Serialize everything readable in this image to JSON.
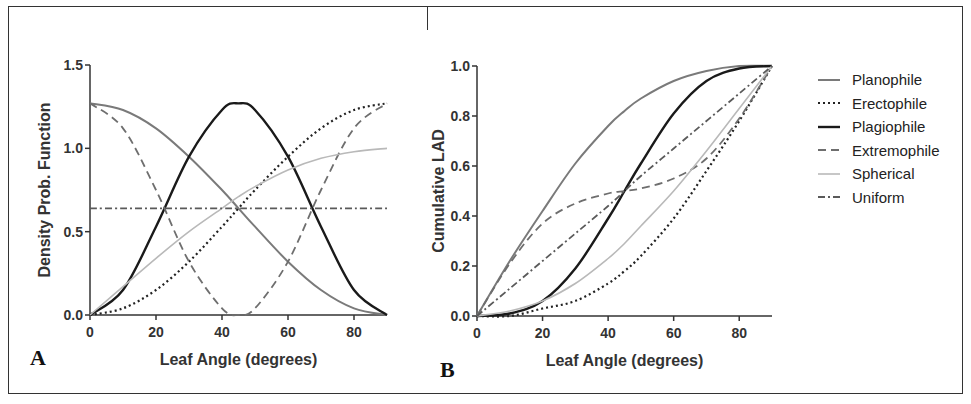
{
  "figure": {
    "panel_labels": [
      "A",
      "B"
    ]
  },
  "legend": {
    "items": [
      {
        "label": "Planophile",
        "color": "#7a7a7a",
        "dash": "",
        "width": 2
      },
      {
        "label": "Erectophile",
        "color": "#222222",
        "dash": "2,3",
        "width": 2.2
      },
      {
        "label": "Plagiophile",
        "color": "#1a1a1a",
        "dash": "",
        "width": 2.4
      },
      {
        "label": "Extremophile",
        "color": "#6e6e6e",
        "dash": "8,5",
        "width": 1.8
      },
      {
        "label": "Spherical",
        "color": "#b9b9b9",
        "dash": "",
        "width": 1.6
      },
      {
        "label": "Uniform",
        "color": "#5a5a5a",
        "dash": "7,3,2,3",
        "width": 1.8
      }
    ]
  },
  "chart_data": [
    {
      "panel": "A",
      "type": "line",
      "title": "",
      "xlabel": "Leaf Angle (degrees)",
      "ylabel": "Density Prob. Function",
      "xlim": [
        0,
        90
      ],
      "ylim": [
        0,
        1.5
      ],
      "xticks": [
        0,
        20,
        40,
        60,
        80
      ],
      "yticks": [
        "0.0",
        "0.5",
        "1.0",
        "1.5"
      ],
      "grid": false,
      "x": [
        0,
        10,
        20,
        30,
        40,
        45,
        50,
        60,
        70,
        80,
        90
      ],
      "series": [
        {
          "name": "Planophile",
          "formula": "(2/pi)(1+cos2θ)",
          "values": [
            1.27,
            1.23,
            1.12,
            0.95,
            0.75,
            0.64,
            0.53,
            0.32,
            0.15,
            0.04,
            0.0
          ]
        },
        {
          "name": "Erectophile",
          "formula": "(2/pi)(1-cos2θ)",
          "values": [
            0.0,
            0.04,
            0.15,
            0.32,
            0.53,
            0.64,
            0.75,
            0.95,
            1.12,
            1.23,
            1.27
          ]
        },
        {
          "name": "Plagiophile",
          "formula": "(2/pi)(1-cos4θ)",
          "values": [
            0.0,
            0.15,
            0.53,
            0.95,
            1.23,
            1.27,
            1.23,
            0.95,
            0.53,
            0.15,
            0.0
          ]
        },
        {
          "name": "Extremophile",
          "formula": "(2/pi)(1+cos4θ)",
          "values": [
            1.27,
            1.12,
            0.75,
            0.32,
            0.04,
            0.0,
            0.04,
            0.32,
            0.75,
            1.12,
            1.27
          ]
        },
        {
          "name": "Spherical",
          "formula": "sinθ",
          "values": [
            0.0,
            0.17,
            0.34,
            0.5,
            0.64,
            0.71,
            0.77,
            0.87,
            0.94,
            0.98,
            1.0
          ]
        },
        {
          "name": "Uniform",
          "formula": "2/pi",
          "values": [
            0.64,
            0.64,
            0.64,
            0.64,
            0.64,
            0.64,
            0.64,
            0.64,
            0.64,
            0.64,
            0.64
          ]
        }
      ]
    },
    {
      "panel": "B",
      "type": "line",
      "title": "",
      "xlabel": "Leaf Angle (degrees)",
      "ylabel": "Cumulative LAD",
      "xlim": [
        0,
        90
      ],
      "ylim": [
        0,
        1.0
      ],
      "xticks": [
        0,
        20,
        40,
        60,
        80
      ],
      "yticks": [
        "0.0",
        "0.2",
        "0.4",
        "0.6",
        "0.8",
        "1.0"
      ],
      "grid": false,
      "legend_position": "right",
      "x": [
        0,
        10,
        20,
        30,
        40,
        45,
        50,
        60,
        70,
        80,
        90
      ],
      "series": [
        {
          "name": "Planophile",
          "values": [
            0.0,
            0.22,
            0.42,
            0.61,
            0.76,
            0.82,
            0.87,
            0.94,
            0.98,
            1.0,
            1.0
          ]
        },
        {
          "name": "Erectophile",
          "values": [
            0.0,
            0.0,
            0.03,
            0.06,
            0.13,
            0.18,
            0.24,
            0.39,
            0.58,
            0.78,
            1.0
          ]
        },
        {
          "name": "Plagiophile",
          "values": [
            0.0,
            0.01,
            0.06,
            0.19,
            0.39,
            0.5,
            0.61,
            0.81,
            0.94,
            0.99,
            1.0
          ]
        },
        {
          "name": "Extremophile",
          "values": [
            0.0,
            0.21,
            0.37,
            0.45,
            0.49,
            0.5,
            0.51,
            0.55,
            0.63,
            0.79,
            1.0
          ]
        },
        {
          "name": "Spherical",
          "values": [
            0.0,
            0.02,
            0.06,
            0.13,
            0.23,
            0.29,
            0.36,
            0.5,
            0.66,
            0.83,
            1.0
          ]
        },
        {
          "name": "Uniform",
          "values": [
            0.0,
            0.11,
            0.22,
            0.33,
            0.44,
            0.5,
            0.56,
            0.67,
            0.78,
            0.89,
            1.0
          ]
        }
      ]
    }
  ]
}
